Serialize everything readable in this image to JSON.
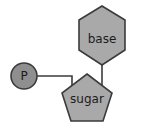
{
  "diagram": {
    "name": "nucleotide-structure",
    "background_color": "#ffffff",
    "width": 147,
    "height": 132,
    "shape_fill_color": "#a9a9a9",
    "phosphate_fill_color": "#8f8f8f",
    "stroke_color": "#3b3b3b",
    "label_color": "#1c1c1c",
    "components": {
      "base": {
        "label": "base",
        "shape": "hexagon"
      },
      "sugar": {
        "label": "sugar",
        "shape": "pentagon"
      },
      "phosphate": {
        "label": "P",
        "shape": "circle"
      }
    },
    "connectors": [
      {
        "name": "phosphate-to-sugar",
        "from": "phosphate",
        "to": "sugar"
      },
      {
        "name": "base-to-sugar",
        "from": "base",
        "to": "sugar"
      }
    ]
  }
}
